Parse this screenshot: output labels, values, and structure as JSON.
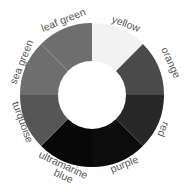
{
  "chart_data": {
    "type": "pie",
    "variant": "donut",
    "title": "",
    "center": [
      92,
      95
    ],
    "outer_radius": 72,
    "inner_radius": 34,
    "segments": [
      {
        "name": "yellow",
        "start": 0,
        "end": 45,
        "fill": "#f2f2f2",
        "value": 1
      },
      {
        "name": "orange",
        "start": 45,
        "end": 90,
        "fill": "#4a4a4a",
        "value": 1
      },
      {
        "name": "red",
        "start": 90,
        "end": 135,
        "fill": "#272727",
        "value": 1
      },
      {
        "name": "purple",
        "start": 135,
        "end": 180,
        "fill": "#0c0c0c",
        "value": 1
      },
      {
        "name": "ultramarine blue",
        "start": 180,
        "end": 225,
        "fill": "#070707",
        "value": 1
      },
      {
        "name": "turquoise",
        "start": 225,
        "end": 270,
        "fill": "#565656",
        "value": 1
      },
      {
        "name": "sea green",
        "start": 270,
        "end": 315,
        "fill": "#6e6e6e",
        "value": 1
      },
      {
        "name": "leaf green",
        "start": 315,
        "end": 360,
        "fill": "#6e6e6e",
        "value": 1
      }
    ]
  },
  "labels": {
    "yellow": "yellow",
    "orange": "orange",
    "red": "red",
    "purple": "purple",
    "ultramarine_1": "ultramarine",
    "ultramarine_2": "blue",
    "turquoise": "turquoise",
    "sea_green": "sea green",
    "leaf_green": "leaf green"
  }
}
